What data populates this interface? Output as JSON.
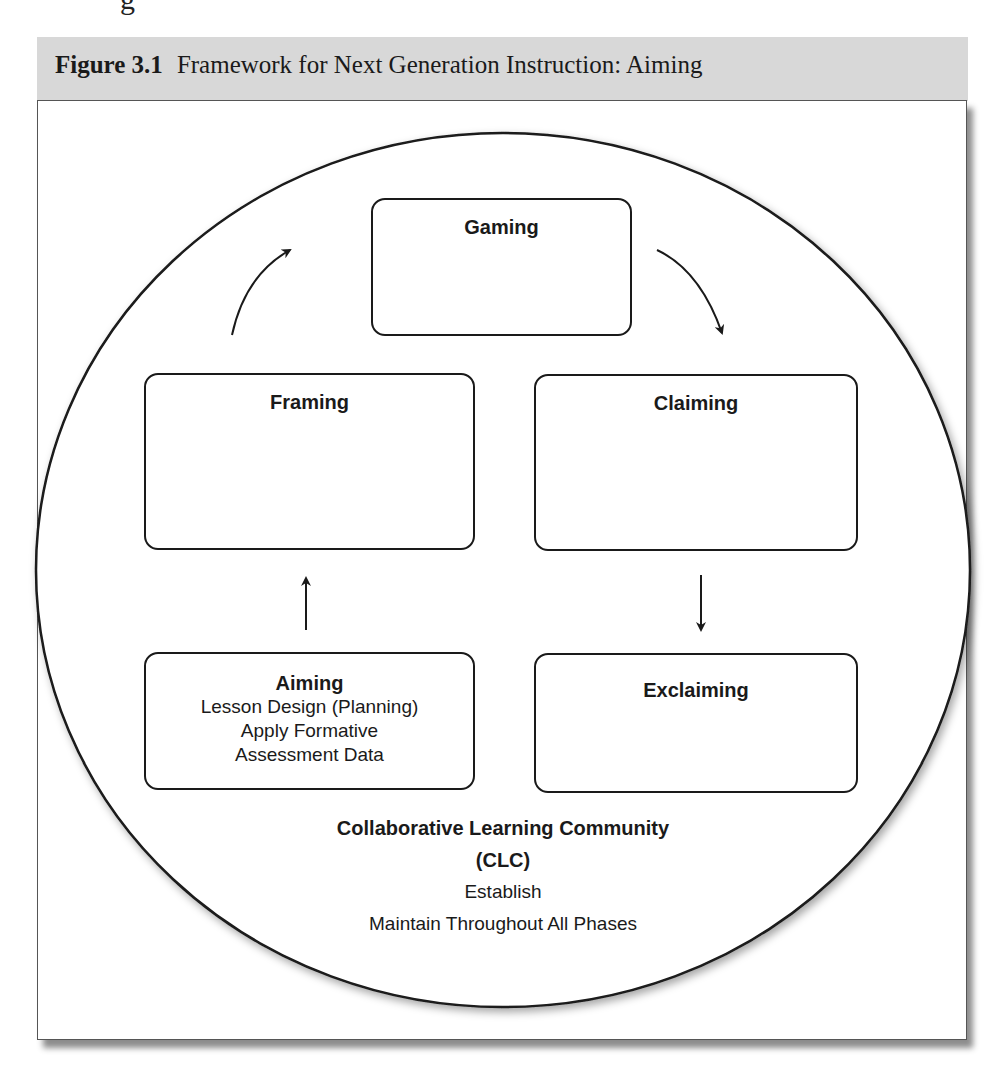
{
  "figure": {
    "label": "Figure 3.1",
    "title": "Framework for Next Generation Instruction: Aiming",
    "top_fragment": "g"
  },
  "phases": {
    "gaming": {
      "title": "Gaming",
      "lines": []
    },
    "framing": {
      "title": "Framing",
      "lines": []
    },
    "claiming": {
      "title": "Claiming",
      "lines": []
    },
    "aiming": {
      "title": "Aiming",
      "lines": [
        "Lesson Design (Planning)",
        "Apply Formative",
        "Assessment Data"
      ]
    },
    "exclaiming": {
      "title": "Exclaiming",
      "lines": []
    }
  },
  "cycle_order": [
    "Aiming",
    "Framing",
    "Gaming",
    "Claiming",
    "Exclaiming"
  ],
  "clc": {
    "title_line1": "Collaborative Learning Community",
    "title_line2": "(CLC)",
    "line1": "Establish",
    "line2": "Maintain Throughout All Phases"
  },
  "colors": {
    "header_band": "#d8d8d8",
    "stroke": "#1a1a1a"
  }
}
